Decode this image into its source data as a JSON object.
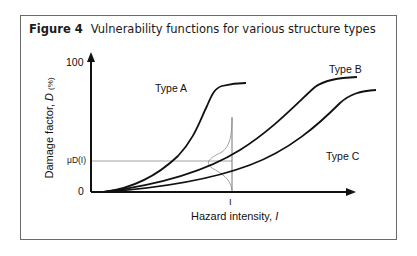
{
  "figure": {
    "number_label": "Figure 4",
    "title": "Vulnerability functions for various structure types"
  },
  "axes": {
    "y_label_text": "Damage factor,",
    "y_label_symbol": "D",
    "y_label_unit": "(%)",
    "y_tick_top": "100",
    "y_tick_bottom": "0",
    "y_mean_label": "μD(I)",
    "x_label_text": "Hazard intensity,",
    "x_label_symbol": "I",
    "x_tick_label": "I"
  },
  "curves": [
    {
      "name": "Type A",
      "label": "Type A"
    },
    {
      "name": "Type B",
      "label": "Type B"
    },
    {
      "name": "Type C",
      "label": "Type C"
    }
  ],
  "colors": {
    "curve": "#111111",
    "guide": "#777777",
    "frame": "#6a6a6a"
  }
}
